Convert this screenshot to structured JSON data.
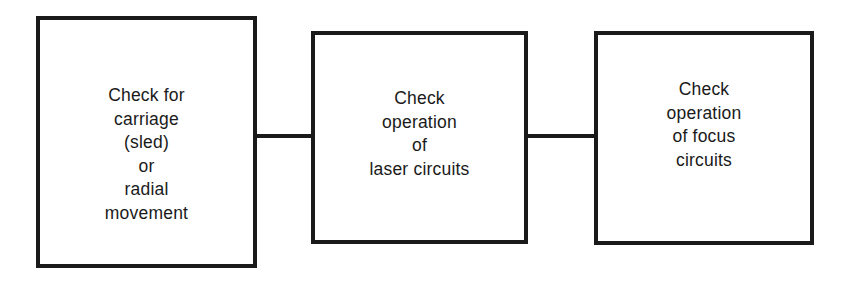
{
  "diagram": {
    "type": "flowchart",
    "direction": "left-to-right",
    "colors": {
      "stroke": "#1a1a1a",
      "background": "#ffffff",
      "text": "#1a1a1a"
    },
    "nodes": [
      {
        "id": "carriage",
        "lines": [
          "Check for",
          "carriage",
          "(sled)",
          "or",
          "radial",
          "movement"
        ]
      },
      {
        "id": "laser",
        "lines": [
          "Check",
          "operation",
          "of",
          "laser circuits"
        ]
      },
      {
        "id": "focus",
        "lines": [
          "Check",
          "operation",
          "of focus",
          "circuits"
        ]
      }
    ],
    "edges": [
      {
        "from": "carriage",
        "to": "laser"
      },
      {
        "from": "laser",
        "to": "focus"
      }
    ]
  }
}
